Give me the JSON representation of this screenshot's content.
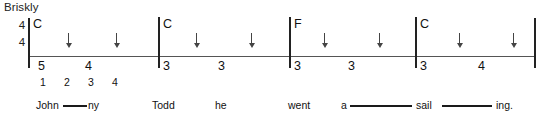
{
  "score": {
    "tempo_marking": "Briskly",
    "time_signature": {
      "numerator": "4",
      "denominator": "4"
    },
    "strum_symbol": "down-arrow",
    "measure_count": 4
  },
  "measures": [
    {
      "chord": "C",
      "frets": [
        "5",
        "4"
      ],
      "strums": [
        "↓",
        "↓"
      ]
    },
    {
      "chord": "C",
      "frets": [
        "3",
        "3"
      ],
      "strums": [
        "↓",
        "↓"
      ]
    },
    {
      "chord": "F",
      "frets": [
        "3",
        "3"
      ],
      "strums": [
        "↓",
        "↓"
      ]
    },
    {
      "chord": "C",
      "frets": [
        "3",
        "4"
      ],
      "strums": [
        "↓",
        "↓"
      ]
    }
  ],
  "beat_counts": [
    "1",
    "2",
    "3",
    "4"
  ],
  "lyrics": [
    {
      "text": "John",
      "extended": true
    },
    {
      "text": "ny",
      "extended": false
    },
    {
      "text": "Todd",
      "extended": false
    },
    {
      "text": "he",
      "extended": false
    },
    {
      "text": "went",
      "extended": false
    },
    {
      "text": "a",
      "extended": true
    },
    {
      "text": "sail",
      "extended": true
    },
    {
      "text": "ing.",
      "extended": false
    }
  ],
  "colors": {
    "ink": "#1a1a1a",
    "staff": "#555555",
    "background": "#ffffff"
  }
}
